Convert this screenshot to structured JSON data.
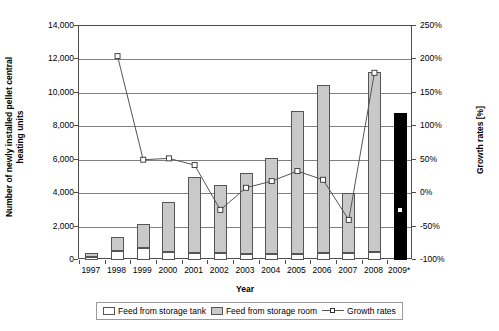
{
  "chart_data": {
    "type": "bar",
    "title": "",
    "xlabel": "Year",
    "ylabel": "Number of newly installed pellet central heating units",
    "ylabel_right": "Growth rates [%]",
    "categories": [
      "1997",
      "1998",
      "1999",
      "2000",
      "2001",
      "2002",
      "2003",
      "2004",
      "2005",
      "2006",
      "2007",
      "2008",
      "2009*"
    ],
    "ylim": [
      0,
      14000
    ],
    "ylim_right": [
      -100,
      250
    ],
    "yticks": [
      "0",
      "2,000",
      "4,000",
      "6,000",
      "8,000",
      "10,000",
      "12,000",
      "14,000"
    ],
    "yticks_right": [
      "-100%",
      "-50%",
      "0%",
      "50%",
      "100%",
      "150%",
      "200%",
      "250%"
    ],
    "grid": true,
    "legend_position": "bottom",
    "series": [
      {
        "name": "Feed from storage tank",
        "type": "bar",
        "color": "#ffffff",
        "values": [
          150,
          550,
          700,
          450,
          400,
          400,
          350,
          350,
          350,
          400,
          400,
          450,
          null
        ]
      },
      {
        "name": "Feed from storage room",
        "type": "bar",
        "color": "#c9c9c9",
        "values": [
          250,
          850,
          1450,
          3050,
          4550,
          4100,
          4850,
          5750,
          8550,
          10100,
          3600,
          10800,
          null
        ]
      },
      {
        "name": "Total (forecast)",
        "type": "bar",
        "color": "#000000",
        "values": [
          null,
          null,
          null,
          null,
          null,
          null,
          null,
          null,
          null,
          null,
          null,
          null,
          8800
        ]
      },
      {
        "name": "Growth rates",
        "type": "line",
        "color": "#555555",
        "values": [
          null,
          205,
          50,
          52,
          42,
          -25,
          8,
          18,
          33,
          20,
          -40,
          180,
          -25
        ]
      }
    ]
  },
  "legend": {
    "items": [
      {
        "label": "Feed from storage tank"
      },
      {
        "label": "Feed from storage room"
      },
      {
        "label": "Growth rates"
      }
    ]
  }
}
